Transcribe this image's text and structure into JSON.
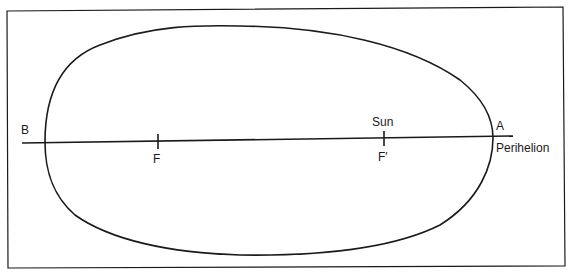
{
  "diagram": {
    "type": "elliptical-orbit",
    "labels": {
      "B": "B",
      "A": "A",
      "F": "F",
      "F_prime": "F′",
      "sun": "Sun",
      "perihelion": "Perihelion"
    },
    "colors": {
      "stroke": "#1a1a1a",
      "background": "#ffffff"
    }
  }
}
